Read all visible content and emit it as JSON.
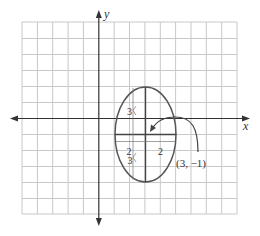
{
  "diagram": {
    "type": "ellipse-on-coordinate-grid",
    "axes": {
      "x_label": "x",
      "y_label": "y"
    },
    "grid": {
      "x_range": [
        -5,
        9
      ],
      "y_range": [
        -6,
        6
      ],
      "step": 1
    },
    "ellipse": {
      "center": [
        3,
        -1
      ],
      "center_label": "(3, −1)",
      "semi_axis_horizontal": 2,
      "semi_axis_vertical": 3,
      "labels": {
        "upper_vertical": "3",
        "lower_vertical": "3",
        "left_horizontal": "2",
        "right_horizontal": "2"
      }
    },
    "colors": {
      "grid": "#c8c8c8",
      "axes": "#333333",
      "ellipse": "#555555",
      "text": "#333333"
    }
  }
}
